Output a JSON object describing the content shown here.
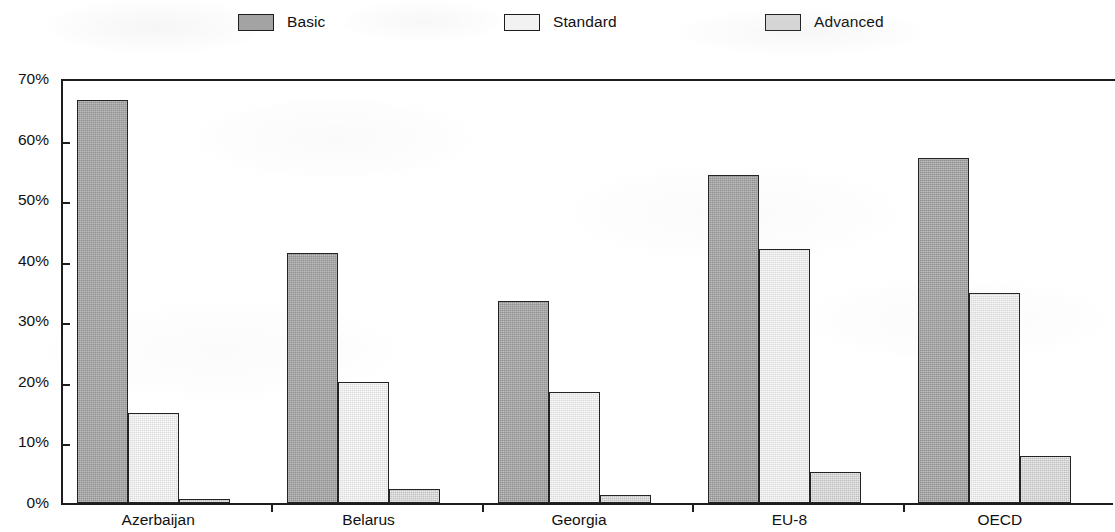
{
  "legend": {
    "items": [
      {
        "label": "Basic",
        "swatch": "basic-swatch",
        "color": "#a3a3a3"
      },
      {
        "label": "Standard",
        "swatch": "standard-swatch",
        "color": "#f2f2f2"
      },
      {
        "label": "Advanced",
        "swatch": "advanced-swatch",
        "color": "#d9d9d9"
      }
    ]
  },
  "axis": {
    "y_ticks": [
      "0%",
      "10%",
      "20%",
      "30%",
      "40%",
      "50%",
      "60%",
      "70%"
    ]
  },
  "chart_data": {
    "type": "bar",
    "title": "",
    "subtitle": "",
    "xlabel": "",
    "ylabel": "",
    "ylim": [
      0,
      70
    ],
    "ytick_values": [
      0,
      10,
      20,
      30,
      40,
      50,
      60,
      70
    ],
    "ytick_labels": [
      "0%",
      "10%",
      "20%",
      "30%",
      "40%",
      "50%",
      "60%",
      "70%"
    ],
    "y_unit": "%",
    "grid": false,
    "legend_position": "top",
    "categories": [
      "Azerbaijan",
      "Belarus",
      "Georgia",
      "EU-8",
      "OECD"
    ],
    "series": [
      {
        "name": "Basic",
        "color": "#a3a3a3",
        "values": [
          66.5,
          41.3,
          33.3,
          54.1,
          57.0
        ]
      },
      {
        "name": "Standard",
        "color": "#f2f2f2",
        "values": [
          14.8,
          19.9,
          18.4,
          42.0,
          34.6
        ]
      },
      {
        "name": "Advanced",
        "color": "#d9d9d9",
        "values": [
          0.7,
          2.3,
          1.4,
          5.2,
          7.7
        ]
      }
    ]
  }
}
